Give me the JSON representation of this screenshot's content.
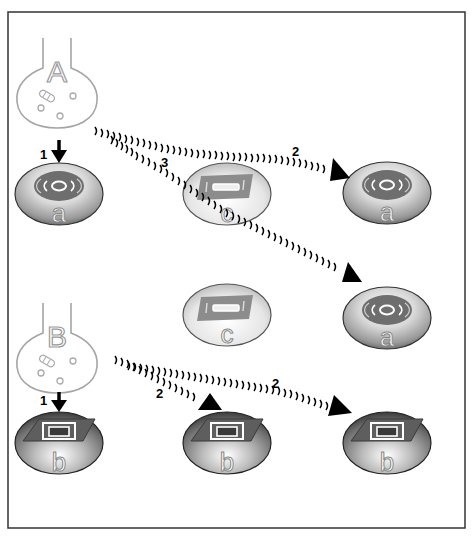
{
  "flasks": [
    {
      "id": "A",
      "label": "A"
    },
    {
      "id": "B",
      "label": "B"
    }
  ],
  "cells": [
    {
      "id": "a1",
      "label": "a",
      "pattern": "concentric-rings"
    },
    {
      "id": "a2",
      "label": "a",
      "pattern": "concentric-rings"
    },
    {
      "id": "a3",
      "label": "a",
      "pattern": "concentric-rings"
    },
    {
      "id": "c1",
      "label": "c",
      "pattern": "rectangle-bar"
    },
    {
      "id": "c2",
      "label": "c",
      "pattern": "rectangle-bar"
    },
    {
      "id": "b1",
      "label": "b",
      "pattern": "nested-squares"
    },
    {
      "id": "b2",
      "label": "b",
      "pattern": "nested-squares"
    },
    {
      "id": "b3",
      "label": "b",
      "pattern": "nested-squares"
    }
  ],
  "arrows": [
    {
      "from": "A",
      "to": "a1",
      "label": "1",
      "style": "solid"
    },
    {
      "from": "A",
      "to": "a2",
      "label": "2",
      "style": "wavy"
    },
    {
      "from": "A",
      "to": "a3",
      "label": "3",
      "style": "wavy"
    },
    {
      "from": "B",
      "to": "b1",
      "label": "1",
      "style": "solid"
    },
    {
      "from": "B",
      "to": "b2",
      "label": "2",
      "style": "wavy"
    },
    {
      "from": "B",
      "to": "b3",
      "label": "2",
      "style": "wavy"
    }
  ],
  "colors": {
    "frame": "#333333",
    "flask": "#999999",
    "cell_dark": "#555555",
    "cell_light": "#f2f2f2",
    "pattern": "#6e6e6e",
    "arrow": "#000000"
  }
}
